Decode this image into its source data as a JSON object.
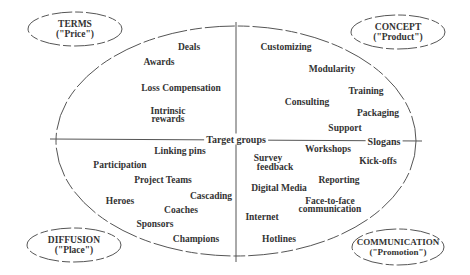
{
  "categories": {
    "top_left": {
      "line1": "TERMS",
      "line2": "(\"Price\")"
    },
    "top_right": {
      "line1": "CONCEPT",
      "line2": "(\"Product\")"
    },
    "bottom_left": {
      "line1": "DIFFUSION",
      "line2": "(\"Place\")"
    },
    "bottom_right": {
      "line1": "COMMUNICATION",
      "line2": "(\"Promotion\")"
    }
  },
  "axes": {
    "center_label": "Target groups",
    "right_label": "Slogans"
  },
  "quadrants": {
    "price": [
      "Deals",
      "Awards",
      "Loss Compensation",
      "Intrinsic",
      "rewards"
    ],
    "product": [
      "Customizing",
      "Modularity",
      "Training",
      "Consulting",
      "Packaging",
      "Support"
    ],
    "place": [
      "Linking pins",
      "Participation",
      "Project Teams",
      "Cascading",
      "Heroes",
      "Coaches",
      "Sponsors",
      "Champions"
    ],
    "promotion": [
      "Workshops",
      "Survey",
      "feedback",
      "Kick-offs",
      "Reporting",
      "Digital Media",
      "Face-to-face",
      "communication",
      "Internet",
      "Hotlines"
    ]
  }
}
